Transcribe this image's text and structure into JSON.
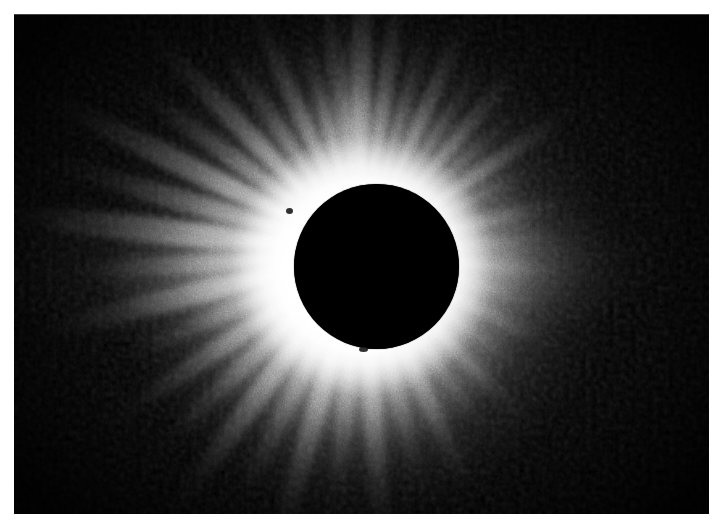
{
  "page": {
    "background_color": "#ffffff",
    "width": 724,
    "height": 529
  },
  "photograph": {
    "subject": "total-solar-eclipse",
    "title": "Total Solar Eclipse Corona",
    "print_bounds": {
      "left": 14,
      "top": 14,
      "width": 695,
      "height": 500
    },
    "background_color": "#000000",
    "highlight_color": "#ffffff",
    "corona_color": "#f2f2f2",
    "sky_color": "#050505"
  },
  "moon_disk": {
    "name": "occulting-moon-disk",
    "center_x": 362,
    "center_y": 252,
    "radius": 82,
    "color": "#000000"
  },
  "corona": {
    "name": "solar-corona",
    "inner_radius": 82,
    "bright_radius": 132,
    "outer_radius": 330,
    "description": "Bright white inner corona with long radial streamers fading into the dark sky",
    "ray_angles_deg": [
      -106,
      -98,
      -90,
      -82,
      -74,
      -66,
      -58,
      -50,
      -42,
      -34,
      -26,
      -14,
      -4,
      6,
      16,
      26,
      36,
      46,
      56,
      66,
      76,
      86,
      96,
      106,
      116,
      126,
      136,
      146,
      156,
      166,
      176,
      186,
      196,
      206,
      216,
      226,
      236,
      246,
      256,
      266
    ],
    "ray_lengths": [
      150,
      205,
      240,
      215,
      175,
      200,
      160,
      185,
      145,
      195,
      130,
      150,
      120,
      135,
      115,
      150,
      125,
      170,
      145,
      200,
      175,
      230,
      195,
      245,
      210,
      250,
      215,
      235,
      190,
      260,
      225,
      300,
      255,
      280,
      215,
      240,
      185,
      210,
      160,
      175
    ],
    "ray_widths": [
      14,
      17,
      20,
      17,
      14,
      16,
      13,
      15,
      12,
      16,
      11,
      13,
      10,
      12,
      10,
      13,
      11,
      14,
      12,
      17,
      15,
      19,
      16,
      20,
      17,
      21,
      18,
      19,
      16,
      22,
      18,
      26,
      21,
      23,
      18,
      20,
      15,
      17,
      13,
      14
    ],
    "ray_opacities": [
      0.42,
      0.55,
      0.68,
      0.58,
      0.44,
      0.52,
      0.4,
      0.48,
      0.36,
      0.5,
      0.32,
      0.38,
      0.28,
      0.34,
      0.26,
      0.38,
      0.3,
      0.44,
      0.36,
      0.54,
      0.46,
      0.64,
      0.52,
      0.68,
      0.56,
      0.7,
      0.58,
      0.62,
      0.5,
      0.72,
      0.6,
      0.8,
      0.66,
      0.74,
      0.56,
      0.62,
      0.46,
      0.52,
      0.4,
      0.44
    ]
  },
  "prominences": [
    {
      "name": "prominence-west-limb",
      "x": 286,
      "y": 208,
      "width": 7,
      "height": 6
    },
    {
      "name": "prominence-south-limb",
      "x": 359,
      "y": 347,
      "width": 9,
      "height": 5
    }
  ],
  "grain": {
    "name": "film-grain",
    "opacity": 0.55,
    "description": "Blotchy photographic film grain visible in the dark sky"
  }
}
